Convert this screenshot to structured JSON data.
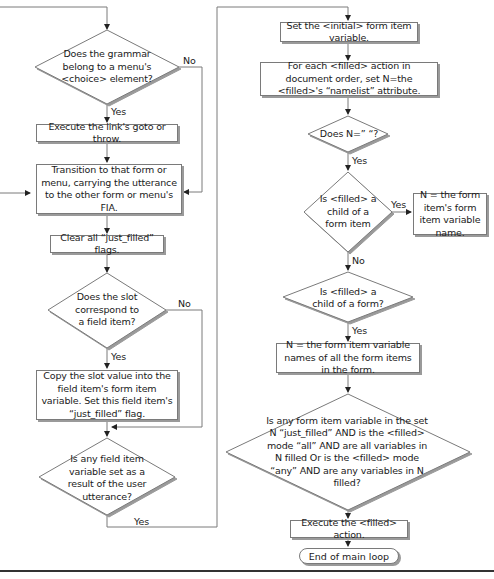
{
  "diagram": {
    "type": "flowchart",
    "left_column": {
      "d1": "Does the grammar belong to a menu's <choice> element?",
      "d1_yes": "Yes",
      "d1_no": "No",
      "b1": "Execute the link's goto or throw.",
      "b2": "Transition to that form or menu, carrying the utterance to the other form or menu's FIA.",
      "b3": "Clear all “just_filled” flags.",
      "d2": "Does the slot correspond to a field item?",
      "d2_yes": "Yes",
      "d2_no": "No",
      "b4": "Copy the slot value into the field item's form item variable. Set this field item's “just_filled” flag.",
      "d3": "Is any field item variable set as a result of the user utterance?",
      "d3_yes": "Yes"
    },
    "right_column": {
      "b5": "Set the <initial> form item variable.",
      "b6": "For each <filled> action in document order, set N=the <filled>'s “namelist” attribute.",
      "d4": "Does N=” “?",
      "d4_yes": "Yes",
      "d5": "Is <filled> a child of a form item",
      "d5_yes": "Yes",
      "d5_no": "No",
      "b7": "N = the form item's form item variable name.",
      "d6": "Is <filled> a child of a form?",
      "d6_yes": "Yes",
      "b8": "N = the form item variable names of all the form items in the form.",
      "d7": "Is any form item variable in the set N “just_filled” AND is the <filled> mode “all” AND are all variables in N filled Or is the <filled> mode “any” AND are any variables in N filled?",
      "b9": "Execute the <filled> action.",
      "end": "End of main loop"
    },
    "colors": {
      "line": "#7a7a7a",
      "shadow": "#9a9a9a",
      "text": "#1a1a1a",
      "rule": "#333333"
    }
  }
}
